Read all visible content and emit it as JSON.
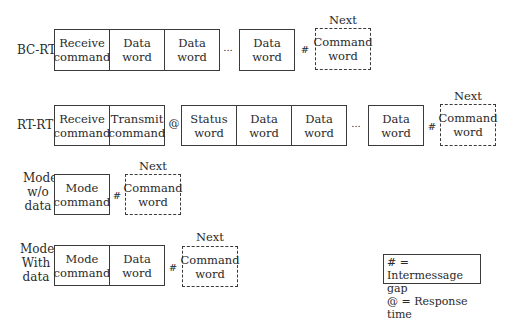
{
  "rows": [
    {
      "label": "BC-RT",
      "boxes": [
        "Receive\ncommand",
        "Data\nword",
        "Data\nword",
        "Data\nword"
      ],
      "ellipsis": "...",
      "gap_symbol": "#",
      "next_label": "Next",
      "next_box": "Command\nword"
    },
    {
      "label": "RT-RT",
      "boxes": [
        "Receive\ncommand",
        "Transmit\ncommand",
        "Status\nword",
        "Data\nword",
        "Data\nword",
        "Data\nword"
      ],
      "response_symbol": "@",
      "ellipsis": "...",
      "gap_symbol": "#",
      "next_label": "Next",
      "next_box": "Command\nword"
    },
    {
      "label": "Mode\nw/o\ndata",
      "boxes": [
        "Mode\ncommand"
      ],
      "gap_symbol": "#",
      "next_label": "Next",
      "next_box": "Command\nword"
    },
    {
      "label": "Mode\nWith\ndata",
      "boxes": [
        "Mode\ncommand",
        "Data\nword"
      ],
      "gap_symbol": "#",
      "next_label": "Next",
      "next_box": "Command\nword"
    }
  ],
  "legend": {
    "line1": "# = Intermessage gap",
    "line2": "@ = Response time"
  }
}
